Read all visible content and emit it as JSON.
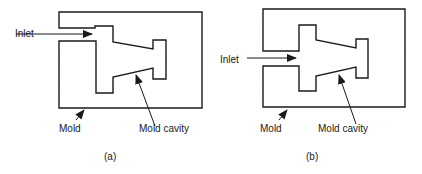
{
  "figures": [
    {
      "id": "a",
      "caption": "(a)",
      "labels": {
        "inlet": "Inlet",
        "mold": "Mold",
        "cavity": "Mold cavity"
      }
    },
    {
      "id": "b",
      "caption": "(b)",
      "labels": {
        "inlet": "Inlet",
        "mold": "Mold",
        "cavity": "Mold cavity"
      }
    }
  ],
  "colors": {
    "line": "#1a1a1a",
    "background": "#ffffff"
  }
}
